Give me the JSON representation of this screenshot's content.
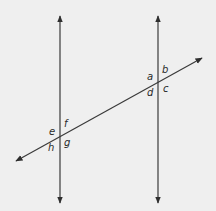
{
  "diagram": {
    "colors": {
      "background": "#efefef",
      "line": "#3a3a3a",
      "label": "#2a2a2a"
    },
    "lines": {
      "left_vertical": {
        "x": 60,
        "y1": 14,
        "y2": 205
      },
      "right_vertical": {
        "x": 158,
        "y1": 14,
        "y2": 205
      },
      "transversal": {
        "x1": 14,
        "y1": 162,
        "x2": 204,
        "y2": 57
      }
    },
    "intersections": {
      "upper_right": {
        "point": [
          158,
          80
        ],
        "labels": [
          "a",
          "b",
          "c",
          "d"
        ]
      },
      "lower_left": {
        "point": [
          60,
          135
        ],
        "labels": [
          "e",
          "f",
          "g",
          "h"
        ]
      }
    },
    "angle_labels": {
      "a": "a",
      "b": "b",
      "c": "c",
      "d": "d",
      "e": "e",
      "f": "f",
      "g": "g",
      "h": "h"
    }
  }
}
